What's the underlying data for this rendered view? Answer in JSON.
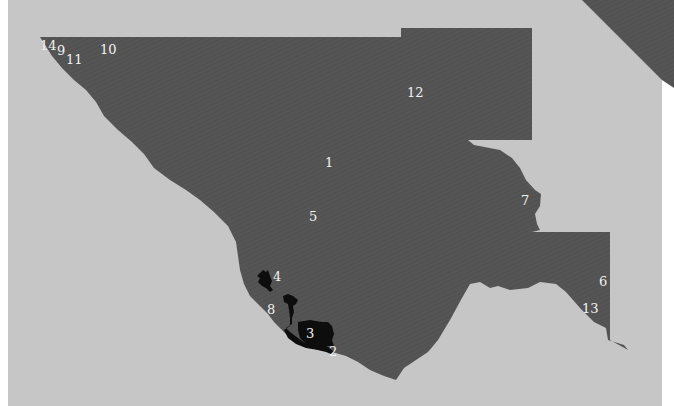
{
  "map": {
    "colors": {
      "background": "#c6c6c6",
      "paper_edge": "#ffffff",
      "region": "#555555",
      "highlight": "#0d0d0d",
      "label": "#f2f2f2"
    },
    "labels": [
      {
        "id": "1",
        "text": "1",
        "x": 329,
        "y": 167
      },
      {
        "id": "2",
        "text": "2",
        "x": 333,
        "y": 355
      },
      {
        "id": "3",
        "text": "3",
        "x": 310,
        "y": 338
      },
      {
        "id": "4",
        "text": "4",
        "x": 277,
        "y": 280
      },
      {
        "id": "5",
        "text": "5",
        "x": 313,
        "y": 220
      },
      {
        "id": "6",
        "text": "6",
        "x": 603,
        "y": 285
      },
      {
        "id": "7",
        "text": "7",
        "x": 525,
        "y": 204
      },
      {
        "id": "8",
        "text": "8",
        "x": 271,
        "y": 313
      },
      {
        "id": "9",
        "text": "9",
        "x": 60,
        "y": 54
      },
      {
        "id": "10",
        "text": "10",
        "x": 108,
        "y": 53
      },
      {
        "id": "11",
        "text": "11",
        "x": 74,
        "y": 63
      },
      {
        "id": "12",
        "text": "12",
        "x": 415,
        "y": 96
      },
      {
        "id": "13",
        "text": "13",
        "x": 591,
        "y": 312
      },
      {
        "id": "14",
        "text": "14",
        "x": 48,
        "y": 49
      }
    ]
  }
}
